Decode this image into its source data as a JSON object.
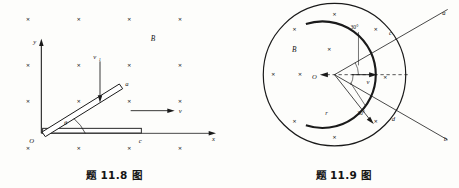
{
  "sheet": {
    "background": "#fdfdfb",
    "ink": "#1a1a1a"
  },
  "figures": [
    {
      "id": "fig-11-8",
      "caption": "题 11.8 图",
      "kind": "cartesian-rod-in-magnetic-field",
      "field_label": "B",
      "field_direction": "into-page",
      "axes": {
        "x_label": "x",
        "y_label": "y",
        "origin_label": "O"
      },
      "labels": {
        "rod_tilted_end": "a",
        "rod_horizontal_end": "c",
        "angle": "θ",
        "velocity_vertical": "v",
        "velocity_vertical_sub": "1",
        "velocity_horizontal": "v"
      },
      "cross_grid": {
        "columns": 4,
        "rows": 4,
        "x": [
          42,
          118,
          194,
          270
        ],
        "y": [
          32,
          82,
          132,
          182
        ],
        "glyph": "×"
      }
    },
    {
      "id": "fig-11-9",
      "caption": "题 11.9 图",
      "kind": "circular-field-region-with-arc-conductor",
      "field_label": "B",
      "field_direction": "into-page",
      "labels": {
        "center": "O",
        "radius": "r",
        "velocity": "v",
        "line_upper_end": "a",
        "line_lower_end": "b",
        "arc_upper_intersection": "c",
        "arc_lower_intersection": "d",
        "angle_upper": "30°",
        "angle_lower": "30°"
      },
      "cross_glyph": "×",
      "cross_count": 10
    }
  ]
}
